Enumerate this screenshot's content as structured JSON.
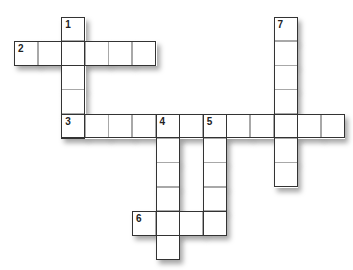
{
  "puzzle": {
    "type": "crossword",
    "cell_width": 23.6,
    "cell_height": 24.3,
    "origin_x": 14,
    "origin_y": 16.5,
    "words": [
      {
        "number": "1",
        "direction": "down",
        "row": 0,
        "col": 2,
        "length": 5
      },
      {
        "number": "2",
        "direction": "across",
        "row": 1,
        "col": 0,
        "length": 6
      },
      {
        "number": "3",
        "direction": "across",
        "row": 4,
        "col": 2,
        "length": 12
      },
      {
        "number": "4",
        "direction": "down",
        "row": 4,
        "col": 6,
        "length": 6
      },
      {
        "number": "5",
        "direction": "down",
        "row": 4,
        "col": 8,
        "length": 5
      },
      {
        "number": "6",
        "direction": "across",
        "row": 8,
        "col": 5,
        "length": 4
      },
      {
        "number": "7",
        "direction": "down",
        "row": 0,
        "col": 11,
        "length": 7
      }
    ]
  }
}
